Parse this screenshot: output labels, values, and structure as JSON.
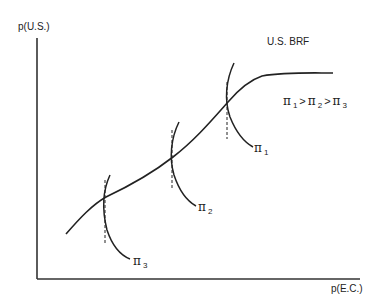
{
  "axes": {
    "y_label": "p(U.S.)",
    "x_label": "p(E.C.)"
  },
  "curve_label": "U.S. BRF",
  "ordering": {
    "text_parts": [
      "π",
      "1",
      ">",
      "π",
      "2",
      ">",
      "π",
      "3"
    ]
  },
  "isoprofit_curves": [
    {
      "symbol": "π",
      "subscript": "1"
    },
    {
      "symbol": "π",
      "subscript": "2"
    },
    {
      "symbol": "π",
      "subscript": "3"
    }
  ],
  "colors": {
    "line": "#222222",
    "axis": "#333333"
  }
}
